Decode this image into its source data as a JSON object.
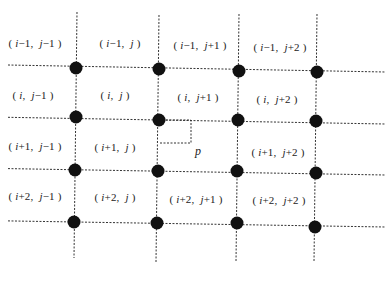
{
  "diagram": {
    "type": "grid-interpolation",
    "horizontal_lines_y": [
      67,
      119,
      170,
      222
    ],
    "vertical_lines_x": [
      76,
      158,
      238,
      316
    ],
    "nodes": [
      {
        "row": 0,
        "col": 0,
        "x": 76,
        "y": 68
      },
      {
        "row": 0,
        "col": 1,
        "x": 159,
        "y": 69
      },
      {
        "row": 0,
        "col": 2,
        "x": 239,
        "y": 71
      },
      {
        "row": 0,
        "col": 3,
        "x": 317,
        "y": 72
      },
      {
        "row": 1,
        "col": 0,
        "x": 76,
        "y": 117
      },
      {
        "row": 1,
        "col": 1,
        "x": 159,
        "y": 120
      },
      {
        "row": 1,
        "col": 2,
        "x": 238,
        "y": 120
      },
      {
        "row": 1,
        "col": 3,
        "x": 316,
        "y": 121
      },
      {
        "row": 2,
        "col": 0,
        "x": 75,
        "y": 170
      },
      {
        "row": 2,
        "col": 1,
        "x": 158,
        "y": 171
      },
      {
        "row": 2,
        "col": 2,
        "x": 237,
        "y": 171
      },
      {
        "row": 2,
        "col": 3,
        "x": 316,
        "y": 173
      },
      {
        "row": 3,
        "col": 0,
        "x": 74,
        "y": 222
      },
      {
        "row": 3,
        "col": 1,
        "x": 157,
        "y": 223
      },
      {
        "row": 3,
        "col": 2,
        "x": 237,
        "y": 223
      },
      {
        "row": 3,
        "col": 3,
        "x": 315,
        "y": 227
      }
    ],
    "cells": [
      {
        "label": "(i−1, j−1)",
        "x": 35,
        "y": 43
      },
      {
        "label": "(i−1, j)",
        "x": 120,
        "y": 43
      },
      {
        "label": "(i−1, j+1)",
        "x": 200,
        "y": 45
      },
      {
        "label": "(i−1, j+2)",
        "x": 280,
        "y": 47
      },
      {
        "label": "(i, j−1)",
        "x": 33,
        "y": 95
      },
      {
        "label": "(i, j)",
        "x": 115,
        "y": 95
      },
      {
        "label": "(i, j+1)",
        "x": 198,
        "y": 97
      },
      {
        "label": "(i, j+2)",
        "x": 277,
        "y": 99
      },
      {
        "label": "(i+1, j−1)",
        "x": 35,
        "y": 146
      },
      {
        "label": "(i+1, j)",
        "x": 115,
        "y": 147
      },
      {
        "label": "(i+1, j+2)",
        "x": 278,
        "y": 152
      },
      {
        "label": "(i+2, j−1)",
        "x": 35,
        "y": 196
      },
      {
        "label": "(i+2, j)",
        "x": 115,
        "y": 197
      },
      {
        "label": "(i+2, j+1)",
        "x": 196,
        "y": 199
      },
      {
        "label": "(i+2, j+2)",
        "x": 279,
        "y": 200
      }
    ],
    "point_p": {
      "label": "p",
      "x": 198,
      "y": 151
    },
    "p_box": {
      "x1": 159,
      "y1": 120,
      "x2": 191,
      "y2": 143
    }
  }
}
